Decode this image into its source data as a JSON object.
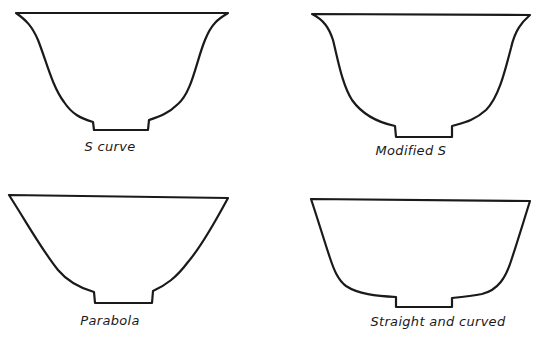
{
  "diagram": {
    "colors": {
      "background": "#ffffff",
      "ink": "#1a1a1a"
    },
    "bowls": [
      {
        "id": "s-curve",
        "label": "S curve",
        "label_pos": {
          "x": 110,
          "y": 139
        },
        "path": "M16,13 L228,13 C220,18 212,22 205,40 C196,62 192,92 178,104 C168,114 158,117 149,120 L148,130 L94,130 L93,122 C80,118 72,114 64,102 C52,86 46,60 38,40 C32,26 26,20 16,13 Z"
      },
      {
        "id": "modified-s",
        "label": "Modified S",
        "label_pos": {
          "x": 411,
          "y": 143
        },
        "path": "M312,14 L530,15 C522,22 515,30 511,48 C504,75 498,98 486,110 C474,121 462,123 452,126 L452,137 L396,137 L395,126 C376,122 362,114 352,100 C342,84 338,60 333,40 C329,28 324,20 312,14 Z"
      },
      {
        "id": "parabola",
        "label": "Parabola",
        "label_pos": {
          "x": 110,
          "y": 313
        },
        "path": "M9,195 L228,198 C214,224 200,248 188,262 C176,278 166,285 153,291 L152,303 L95,303 L94,292 C80,288 68,282 58,270 C42,250 30,228 9,195 Z"
      },
      {
        "id": "straight-and-curved",
        "label": "Straight and curved",
        "label_pos": {
          "x": 438,
          "y": 314
        },
        "path": "M311,199 L530,201 C524,220 518,240 512,258 C506,278 498,290 482,294 C472,296 462,297 452,298 L452,307 L396,307 L396,297 C376,296 358,294 346,286 C338,280 334,270 330,258 C324,240 318,220 311,199 Z"
      }
    ]
  }
}
